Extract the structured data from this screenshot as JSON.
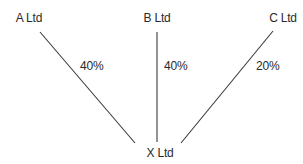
{
  "diagram": {
    "type": "ownership-structure",
    "nodes": {
      "a": {
        "label": "A Ltd"
      },
      "b": {
        "label": "B Ltd"
      },
      "c": {
        "label": "C Ltd"
      },
      "x": {
        "label": "X Ltd"
      }
    },
    "edges": [
      {
        "from": "A Ltd",
        "to": "X Ltd",
        "label": "40%"
      },
      {
        "from": "B Ltd",
        "to": "X Ltd",
        "label": "40%"
      },
      {
        "from": "C Ltd",
        "to": "X Ltd",
        "label": "20%"
      }
    ],
    "edge_labels": {
      "a_to_x": "40%",
      "b_to_x": "40%",
      "c_to_x": "20%"
    },
    "line_color": "#3a3a3a"
  }
}
